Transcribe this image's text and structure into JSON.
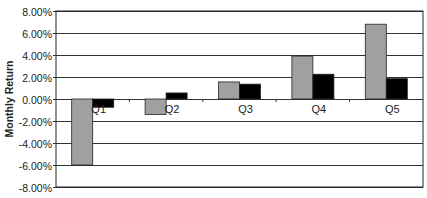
{
  "chart_data": {
    "type": "bar",
    "title": "",
    "xlabel": "",
    "ylabel": "Monthly Return",
    "categories": [
      "Q1",
      "Q2",
      "Q3",
      "Q4",
      "Q5"
    ],
    "series": [
      {
        "name": "Series 1",
        "color": "#a0a0a0",
        "values": [
          -6.0,
          -1.4,
          1.55,
          3.9,
          6.8
        ]
      },
      {
        "name": "Series 2",
        "color": "#000000",
        "values": [
          -0.75,
          0.55,
          1.35,
          2.25,
          1.85
        ]
      }
    ],
    "ylim": [
      -8,
      8
    ],
    "yticks": [
      8,
      6,
      4,
      2,
      0,
      -2,
      -4,
      -6,
      -8
    ],
    "ytick_labels": [
      "8.00%",
      "6.00%",
      "4.00%",
      "2.00%",
      "0.00%",
      "-2.00%",
      "-4.00%",
      "-6.00%",
      "-8.00%"
    ],
    "grid": true,
    "legend": false
  }
}
